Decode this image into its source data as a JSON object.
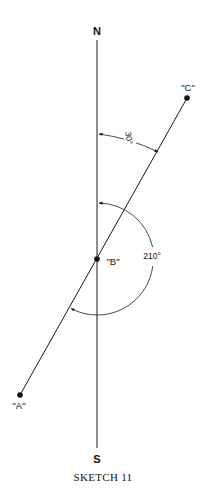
{
  "diagram": {
    "north_label": "N",
    "south_label": "S",
    "caption": "SKETCH 11",
    "points": {
      "A": {
        "label": "\"A\""
      },
      "B": {
        "label": "\"B\""
      },
      "C": {
        "label": "\"C\""
      }
    },
    "angles": {
      "bearing_small": "30°",
      "bearing_large": "210°"
    },
    "colors": {
      "line": "#1a1a1a",
      "background": "#ffffff"
    }
  }
}
